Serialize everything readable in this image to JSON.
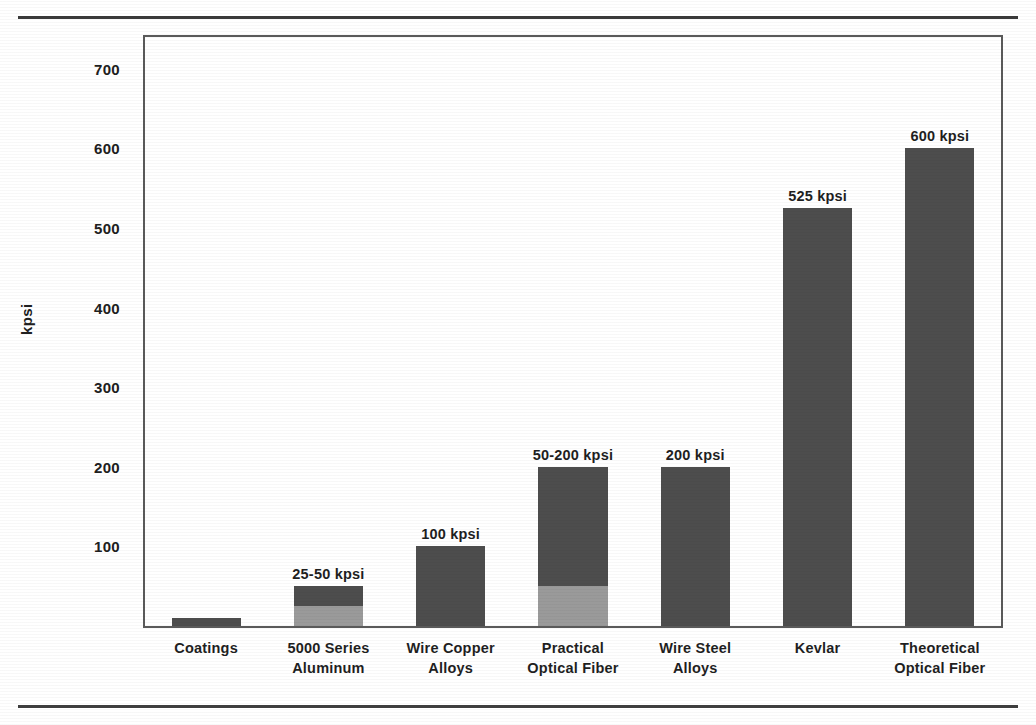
{
  "page": {
    "clipped_header_text": "",
    "top_rule": "horizontal-rule",
    "bottom_rule": "horizontal-rule"
  },
  "chart_data": {
    "type": "bar",
    "title": "",
    "xlabel": "",
    "ylabel": "kpsi",
    "ylim": [
      0,
      740
    ],
    "grid": false,
    "legend": "none",
    "y_ticks": [
      100,
      200,
      300,
      400,
      500,
      600,
      700
    ],
    "categories": [
      "Coatings",
      "5000 Series Aluminum",
      "Wire Copper Alloys",
      "Practical Optical Fiber",
      "Wire Steel Alloys",
      "Kevlar",
      "Theoretical Optical Fiber"
    ],
    "category_lines": [
      [
        "Coatings"
      ],
      [
        "5000 Series",
        "Aluminum"
      ],
      [
        "Wire Copper",
        "Alloys"
      ],
      [
        "Practical",
        "Optical Fiber"
      ],
      [
        "Wire Steel",
        "Alloys"
      ],
      [
        "Kevlar"
      ],
      [
        "Theoretical",
        "Optical Fiber"
      ]
    ],
    "values": [
      10,
      50,
      100,
      200,
      200,
      525,
      600
    ],
    "value_low": [
      null,
      25,
      null,
      50,
      null,
      null,
      null
    ],
    "data_labels": [
      "",
      "25-50 kpsi",
      "100 kpsi",
      "50-200 kpsi",
      "200 kpsi",
      "525 kpsi",
      "600 kpsi"
    ],
    "colors": {
      "bar_fill": "#4d4d4d",
      "bar_fill_light": "#9a9a9a",
      "axis": "#5a5a5a",
      "text": "#1f1f1f",
      "background": "#ffffff"
    }
  },
  "y_axis": {
    "title": "kpsi",
    "ticks": [
      {
        "label": "700"
      },
      {
        "label": "600"
      },
      {
        "label": "500"
      },
      {
        "label": "400"
      },
      {
        "label": "300"
      },
      {
        "label": "200"
      },
      {
        "label": "100"
      }
    ]
  }
}
